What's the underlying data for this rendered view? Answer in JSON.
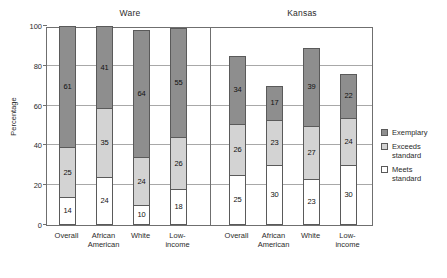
{
  "chart_data": {
    "type": "bar",
    "subtype": "stacked-bar-grouped",
    "title": "",
    "xlabel": "",
    "ylabel": "Percentage",
    "ylim": [
      0,
      100
    ],
    "yticks": [
      0,
      20,
      40,
      60,
      80,
      100
    ],
    "grid": true,
    "legend_position": "right",
    "panels": [
      {
        "name": "Ware",
        "categories": [
          "Overall",
          "African American",
          "White",
          "Low-income"
        ],
        "series": [
          {
            "name": "Meets standard",
            "values": [
              14,
              24,
              10,
              18
            ]
          },
          {
            "name": "Exceeds standard",
            "values": [
              25,
              35,
              24,
              26
            ]
          },
          {
            "name": "Exemplary",
            "values": [
              61,
              41,
              64,
              55
            ]
          }
        ],
        "totals": [
          100,
          100,
          98,
          99
        ]
      },
      {
        "name": "Kansas",
        "categories": [
          "Overall",
          "African American",
          "White",
          "Low-income"
        ],
        "series": [
          {
            "name": "Meets standard",
            "values": [
              25,
              30,
              23,
              30
            ]
          },
          {
            "name": "Exceeds standard",
            "values": [
              26,
              23,
              27,
              24
            ]
          },
          {
            "name": "Exemplary",
            "values": [
              34,
              17,
              39,
              22
            ]
          }
        ],
        "totals": [
          85,
          70,
          89,
          76
        ]
      }
    ],
    "legend": [
      {
        "label": "Exemplary",
        "color": "#8e8e8e"
      },
      {
        "label": "Exceeds standard",
        "color": "#d3d3d3"
      },
      {
        "label": "Meets standard",
        "color": "#ffffff"
      }
    ],
    "colors": {
      "exemplary": "#8e8e8e",
      "exceeds": "#d3d3d3",
      "meets": "#ffffff",
      "axis": "#6f6f6f",
      "grid": "#a8a8a8",
      "text": "#2b2b2b"
    }
  }
}
